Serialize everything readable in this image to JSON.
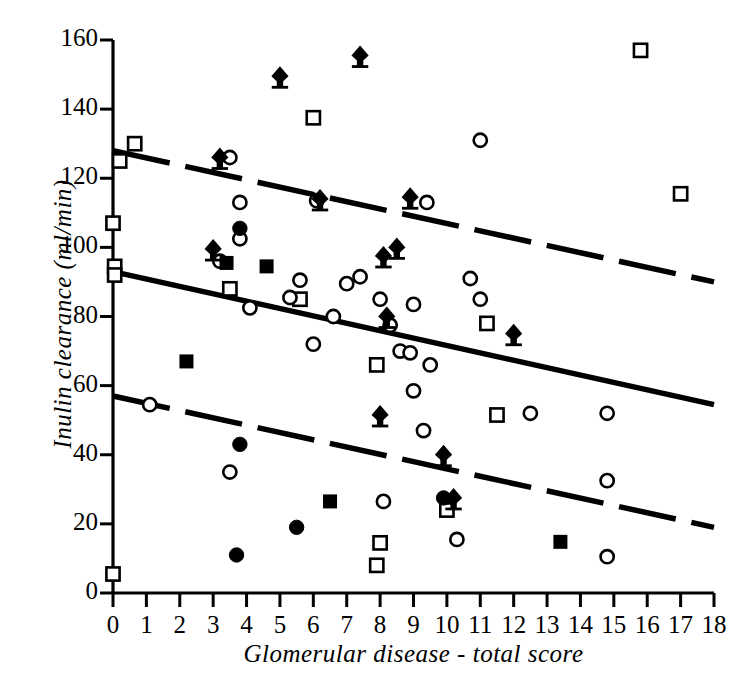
{
  "chart_data": {
    "type": "scatter",
    "title": "",
    "xlabel": "Glomerular disease - total score",
    "ylabel": "Inulin clearance (ml/min)",
    "xlim": [
      0,
      18
    ],
    "ylim": [
      0,
      160
    ],
    "xticks": [
      0,
      1,
      2,
      3,
      4,
      5,
      6,
      7,
      8,
      9,
      10,
      11,
      12,
      13,
      14,
      15,
      16,
      17,
      18
    ],
    "yticks": [
      0,
      20,
      40,
      60,
      80,
      100,
      120,
      140,
      160
    ],
    "grid": false,
    "legend": "none",
    "series": [
      {
        "name": "filled-diamond",
        "marker": "filled-diamond",
        "points": [
          [
            5.0,
            149.5
          ],
          [
            7.4,
            155.5
          ],
          [
            3.2,
            126.0
          ],
          [
            6.2,
            114.0
          ],
          [
            8.9,
            114.5
          ],
          [
            3.0,
            99.5
          ],
          [
            8.1,
            97.5
          ],
          [
            8.5,
            100.0
          ],
          [
            8.2,
            80.0
          ],
          [
            12.0,
            75.0
          ],
          [
            9.9,
            40.0
          ],
          [
            10.2,
            27.5
          ],
          [
            8.0,
            51.5
          ]
        ]
      },
      {
        "name": "open-square",
        "marker": "open-square",
        "points": [
          [
            15.8,
            157.0
          ],
          [
            6.0,
            137.5
          ],
          [
            0.65,
            130.0
          ],
          [
            0.2,
            125.0
          ],
          [
            17.0,
            115.5
          ],
          [
            0.0,
            107.0
          ],
          [
            0.05,
            94.5
          ],
          [
            0.05,
            92.0
          ],
          [
            3.5,
            88.0
          ],
          [
            5.6,
            85.0
          ],
          [
            11.2,
            78.0
          ],
          [
            7.9,
            66.0
          ],
          [
            11.5,
            51.5
          ],
          [
            10.0,
            24.0
          ],
          [
            8.0,
            14.5
          ],
          [
            7.9,
            8.0
          ],
          [
            0.0,
            5.5
          ]
        ]
      },
      {
        "name": "filled-square",
        "marker": "filled-square",
        "points": [
          [
            3.4,
            95.5
          ],
          [
            4.6,
            94.5
          ],
          [
            2.2,
            67.0
          ],
          [
            6.5,
            26.5
          ],
          [
            13.4,
            14.8
          ]
        ]
      },
      {
        "name": "open-circle",
        "marker": "open-circle",
        "points": [
          [
            3.5,
            126.0
          ],
          [
            11.0,
            131.0
          ],
          [
            6.1,
            113.5
          ],
          [
            3.8,
            113.0
          ],
          [
            9.4,
            113.0
          ],
          [
            3.8,
            102.5
          ],
          [
            3.2,
            96.0
          ],
          [
            5.6,
            90.5
          ],
          [
            7.0,
            89.5
          ],
          [
            7.4,
            91.5
          ],
          [
            10.7,
            91.0
          ],
          [
            5.3,
            85.5
          ],
          [
            6.6,
            80.0
          ],
          [
            8.0,
            85.0
          ],
          [
            11.0,
            85.0
          ],
          [
            9.0,
            83.5
          ],
          [
            4.1,
            82.5
          ],
          [
            8.3,
            77.5
          ],
          [
            6.0,
            72.0
          ],
          [
            8.6,
            70.0
          ],
          [
            8.9,
            69.5
          ],
          [
            9.5,
            66.0
          ],
          [
            9.0,
            58.5
          ],
          [
            12.5,
            52.0
          ],
          [
            14.8,
            52.0
          ],
          [
            1.1,
            54.5
          ],
          [
            9.3,
            47.0
          ],
          [
            14.8,
            32.5
          ],
          [
            3.5,
            35.0
          ],
          [
            8.1,
            26.5
          ],
          [
            10.3,
            15.5
          ],
          [
            14.8,
            10.5
          ]
        ]
      },
      {
        "name": "filled-circle",
        "marker": "filled-circle",
        "points": [
          [
            3.8,
            105.5
          ],
          [
            3.8,
            43.0
          ],
          [
            5.5,
            19.0
          ],
          [
            3.7,
            11.0
          ],
          [
            9.9,
            27.5
          ]
        ]
      }
    ],
    "lines": [
      {
        "name": "upper-confidence-line",
        "style": "dashed",
        "x": [
          0,
          18
        ],
        "y": [
          128.0,
          90.0
        ]
      },
      {
        "name": "regression-line",
        "style": "solid",
        "x": [
          0,
          18
        ],
        "y": [
          93.0,
          54.5
        ]
      },
      {
        "name": "lower-confidence-line",
        "style": "dashed",
        "x": [
          0,
          18
        ],
        "y": [
          57.0,
          19.0
        ]
      }
    ],
    "colors": {
      "foreground": "#000000",
      "background": "#ffffff"
    }
  }
}
